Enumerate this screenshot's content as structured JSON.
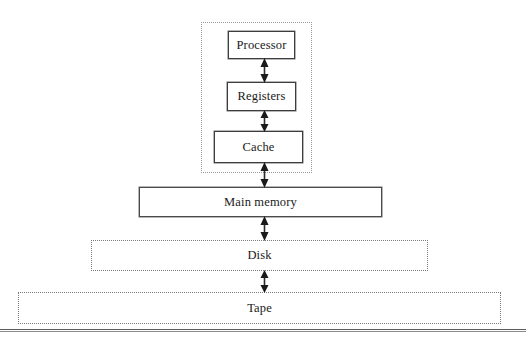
{
  "diagram": {
    "nodes": [
      {
        "id": "processor",
        "label": "Processor",
        "border": "solid",
        "x": 228,
        "y": 31,
        "w": 67,
        "h": 28
      },
      {
        "id": "registers",
        "label": "Registers",
        "border": "solid",
        "x": 227,
        "y": 82,
        "w": 69,
        "h": 29
      },
      {
        "id": "cache",
        "label": "Cache",
        "border": "solid",
        "x": 214,
        "y": 131,
        "w": 89,
        "h": 32
      },
      {
        "id": "main-memory",
        "label": "Main memory",
        "border": "solid",
        "x": 139,
        "y": 187,
        "w": 243,
        "h": 30
      },
      {
        "id": "disk",
        "label": "Disk",
        "border": "dotted",
        "x": 91,
        "y": 240,
        "w": 337,
        "h": 31
      },
      {
        "id": "tape",
        "label": "Tape",
        "border": "dotted",
        "x": 18,
        "y": 292,
        "w": 483,
        "h": 32
      }
    ],
    "enclosure": {
      "id": "cpu-enclosure",
      "label": "",
      "border": "dotted",
      "x": 201,
      "y": 22,
      "w": 111,
      "h": 151
    },
    "connectors": [
      {
        "id": "processor-registers",
        "from": "processor",
        "to": "registers",
        "direction": "bidirectional",
        "x": 258,
        "y": 58,
        "h": 25
      },
      {
        "id": "registers-cache",
        "from": "registers",
        "to": "cache",
        "direction": "bidirectional",
        "x": 258,
        "y": 110,
        "h": 22
      },
      {
        "id": "cache-main-memory",
        "from": "cache",
        "to": "main-memory",
        "direction": "bidirectional",
        "x": 258,
        "y": 162,
        "h": 26
      },
      {
        "id": "main-memory-disk",
        "from": "main-memory",
        "to": "disk",
        "direction": "bidirectional",
        "x": 258,
        "y": 216,
        "h": 25
      },
      {
        "id": "disk-tape",
        "from": "disk",
        "to": "tape",
        "direction": "bidirectional",
        "x": 258,
        "y": 270,
        "h": 23
      }
    ],
    "bottom_rule": {
      "id": "bottom-rule",
      "style": "double-horizontal-line"
    }
  },
  "colors": {
    "background": "#ffffff",
    "solid_border": "#4a4a4a",
    "dotted_border": "#7a7a7a",
    "enclosure_border": "#9a9a9a",
    "text": "#1a1a1a",
    "rule": "#5a5a5a"
  }
}
